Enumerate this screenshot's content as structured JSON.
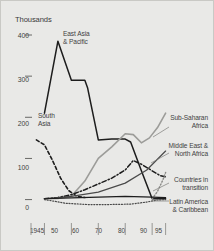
{
  "chart_data": {
    "type": "line",
    "title": "",
    "subtitle": "",
    "xlabel": "",
    "ylabel": "Thousands",
    "xlim": [
      1945,
      1997
    ],
    "ylim": [
      -18,
      400
    ],
    "grid": false,
    "legend_position": "inline-annotations",
    "y_ticks": [
      0,
      100,
      200,
      300,
      400
    ],
    "y_tick_labels": [
      "0",
      "100",
      "200",
      "300",
      "400"
    ],
    "x_ticks": [
      1945,
      1950,
      1960,
      1970,
      1980,
      1990,
      1995
    ],
    "x_tick_labels": [
      "1945",
      "50",
      "60",
      "70",
      "80",
      "90",
      "95"
    ],
    "series": [
      {
        "name": "East Asia & Pacific",
        "style": "solid",
        "color": "#1d1d1d",
        "width": 1.5,
        "x": [
          1950,
          1955,
          1960,
          1965,
          1966,
          1970,
          1975,
          1980,
          1982,
          1986,
          1990,
          1995
        ],
        "values": [
          210,
          385,
          290,
          290,
          272,
          145,
          147,
          147,
          140,
          70,
          2,
          2
        ]
      },
      {
        "name": "South Asia",
        "style": "dashed",
        "color": "#1d1d1d",
        "width": 1.6,
        "x": [
          1947,
          1950,
          1953,
          1956,
          1959,
          1962,
          1965
        ],
        "values": [
          145,
          133,
          95,
          52,
          22,
          8,
          5
        ]
      },
      {
        "name": "Sub-Saharan Africa",
        "style": "solid",
        "color": "#9c9c99",
        "width": 1.6,
        "x": [
          1950,
          1955,
          1960,
          1965,
          1970,
          1975,
          1980,
          1983,
          1986,
          1989,
          1992,
          1995
        ],
        "values": [
          2,
          3,
          8,
          45,
          100,
          128,
          160,
          158,
          138,
          150,
          175,
          210
        ]
      },
      {
        "name": "Middle East & North Africa",
        "style": "dash-dot",
        "color": "#1d1d1d",
        "width": 1.5,
        "x": [
          1950,
          1955,
          1960,
          1965,
          1970,
          1975,
          1980,
          1983,
          1986,
          1990,
          1993,
          1995
        ],
        "values": [
          2,
          5,
          12,
          24,
          38,
          52,
          72,
          95,
          86,
          70,
          58,
          55
        ]
      },
      {
        "name": "Middle East & North Africa (rising)",
        "style": "solid",
        "color": "#4a4a4a",
        "width": 1.2,
        "x": [
          1950,
          1960,
          1970,
          1980,
          1988,
          1995
        ],
        "values": [
          2,
          8,
          18,
          40,
          72,
          118
        ]
      },
      {
        "name": "Countries in transition",
        "style": "dotted",
        "color": "#8a8a87",
        "width": 1.4,
        "x": [
          1990,
          1992,
          1994,
          1995
        ],
        "values": [
          2,
          20,
          48,
          66
        ]
      },
      {
        "name": "Latin America & Caribbean",
        "style": "solid",
        "color": "#1d1d1d",
        "width": 1.2,
        "x": [
          1950,
          1960,
          1970,
          1980,
          1990,
          1995
        ],
        "values": [
          2,
          4,
          6,
          8,
          6,
          5
        ]
      },
      {
        "name": "Latin America & Caribbean (dotted)",
        "style": "dotted",
        "color": "#4a4a4a",
        "width": 1.2,
        "x": [
          1950,
          1958,
          1966,
          1974,
          1982,
          1988,
          1992,
          1995
        ],
        "values": [
          0,
          -9,
          -12,
          -12,
          -11,
          -6,
          -1,
          0
        ]
      }
    ],
    "annotations": [
      {
        "id": "east-asia-pacific",
        "text_lines": [
          "East Asia",
          "& Pacific"
        ],
        "align": "left"
      },
      {
        "id": "south-asia",
        "text_lines": [
          "South",
          "Asia"
        ],
        "align": "left"
      },
      {
        "id": "sub-saharan-africa",
        "text_lines": [
          "Sub-Saharan",
          "Africa"
        ],
        "align": "right"
      },
      {
        "id": "middle-east-north-africa",
        "text_lines": [
          "Middle East &",
          "North Africa"
        ],
        "align": "right"
      },
      {
        "id": "countries-in-transition",
        "text_lines": [
          "Countries in",
          "transition"
        ],
        "align": "right"
      },
      {
        "id": "latin-america-caribbean",
        "text_lines": [
          "Latin America",
          "& Caribbean"
        ],
        "align": "right"
      }
    ]
  },
  "annotation_text": {
    "east_asia_l1": "East Asia",
    "east_asia_l2": "& Pacific",
    "south_asia_l1": "South",
    "south_asia_l2": "Asia",
    "sub_saharan_l1": "Sub-Saharan",
    "sub_saharan_l2": "Africa",
    "middle_east_l1": "Middle East &",
    "middle_east_l2": "North Africa",
    "transition_l1": "Countries in",
    "transition_l2": "transition",
    "latin_america_l1": "Latin America",
    "latin_america_l2": "& Caribbean"
  },
  "axis": {
    "units_label": "Thousands",
    "y_0": "0",
    "y_100": "100",
    "y_200": "200",
    "y_300": "300",
    "y_400": "400",
    "x_1945": "1945",
    "x_50": "50",
    "x_60": "60",
    "x_70": "70",
    "x_80": "80",
    "x_90": "90",
    "x_95": "95"
  },
  "colors": {
    "background": "#e9e9e7",
    "border": "#c9c9c5",
    "ink": "#1d1d1d",
    "gray_series": "#9c9c99",
    "text": "#3f3f3f"
  }
}
